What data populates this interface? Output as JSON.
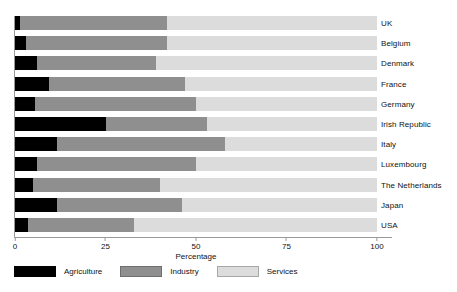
{
  "chart_data": {
    "type": "bar",
    "subtype": "horizontal-stacked-100",
    "title": "",
    "xlabel": "Percentage",
    "ylabel": "",
    "xlim": [
      0,
      100
    ],
    "xticks": [
      0,
      25,
      50,
      75,
      100
    ],
    "xtick_labels": [
      "0",
      "25",
      "50",
      "75",
      "100"
    ],
    "grid": false,
    "legend_position": "bottom-left",
    "categories": [
      "UK",
      "Belgium",
      "Denmark",
      "France",
      "Germany",
      "Irish Republic",
      "Italy",
      "Luxembourg",
      "The Netherlands",
      "Japan",
      "USA"
    ],
    "series": [
      {
        "name": "Agriculture",
        "color": "#000000",
        "values": [
          1.5,
          3,
          6,
          9.5,
          5.5,
          25,
          11.5,
          6,
          5,
          11.5,
          3.5
        ]
      },
      {
        "name": "Industry",
        "color": "#8f8f8f",
        "values": [
          40.5,
          39,
          33,
          37.5,
          44.5,
          28,
          46.5,
          44,
          35,
          34.5,
          29.5
        ]
      },
      {
        "name": "Services",
        "color": "#dcdcdc",
        "values": [
          58,
          58,
          61,
          53,
          50,
          47,
          42,
          50,
          60,
          54,
          67
        ]
      }
    ]
  },
  "axis": {
    "x_title": "Percentage"
  },
  "legend": {
    "items": [
      {
        "label": "Agriculture",
        "swatch": "swatch-agriculture"
      },
      {
        "label": "Industry",
        "swatch": "swatch-industry"
      },
      {
        "label": "Services",
        "swatch": "swatch-services"
      }
    ]
  },
  "caption": {
    "text": ""
  }
}
